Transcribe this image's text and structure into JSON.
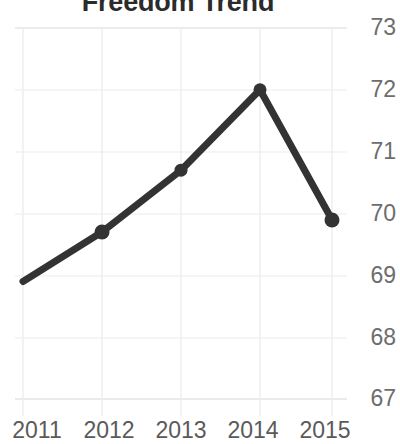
{
  "chart_data": {
    "type": "line",
    "title": "Freedom Trend",
    "xlabel": "",
    "ylabel": "",
    "x": [
      2011,
      2012,
      2013,
      2014,
      2015
    ],
    "categories": [
      "2011",
      "2012",
      "2013",
      "2014",
      "2015"
    ],
    "values": [
      68.9,
      69.7,
      70.7,
      72.0,
      69.9
    ],
    "series": [
      {
        "name": "Freedom Score",
        "values": [
          68.9,
          69.7,
          70.7,
          72.0,
          69.9
        ]
      }
    ],
    "ylim": [
      67,
      73
    ],
    "yticks": [
      67,
      68,
      69,
      70,
      71,
      72,
      73
    ],
    "ytick_labels": [
      "67",
      "68",
      "69",
      "70",
      "71",
      "72",
      "73"
    ],
    "xtick_labels": [
      "2011",
      "2012",
      "2013",
      "2014",
      "2015"
    ],
    "grid": true,
    "legend": false,
    "legend_position": "none",
    "line_color": "#333333",
    "marker_color": "#333333",
    "grid_color": "#e6e6e6",
    "axis_label_color": "#6d6d6d",
    "background_color": "#ffffff"
  }
}
